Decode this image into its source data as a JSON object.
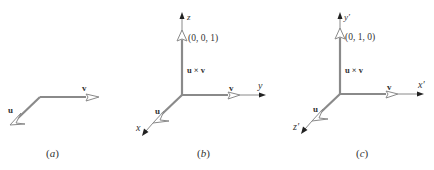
{
  "figure": {
    "colors": {
      "vector": "#8a8a8a",
      "axis": "#8a8a8a",
      "arrowhead": "#222222",
      "text": "#333333"
    },
    "panels": [
      {
        "id": "a",
        "caption": "(a)",
        "vector_u_label": "u",
        "vector_v_label": "v"
      },
      {
        "id": "b",
        "caption": "(b)",
        "vector_u_label": "u",
        "vector_v_label": "v",
        "cross_label": "u × v",
        "cross_point": "(0, 0, 1)",
        "axis_up": "z",
        "axis_right": "y",
        "axis_down": "x"
      },
      {
        "id": "c",
        "caption": "(c)",
        "vector_u_label": "u",
        "vector_v_label": "v",
        "cross_label": "u × v",
        "cross_point": "(0, 1, 0)",
        "axis_up": "y′",
        "axis_right": "x′",
        "axis_down": "z′"
      }
    ]
  }
}
